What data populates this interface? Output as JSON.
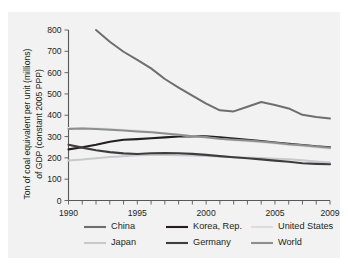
{
  "figure": {
    "background": "#f2f2f2",
    "page_background": "#ffffff"
  },
  "chart_data": {
    "type": "line",
    "title": "",
    "subtitle": "",
    "xlabel": "",
    "ylabel": "Ton of coal equivalent per unit (millions) of GDP (constant 2005 PPP)",
    "ylabel_line1": "Ton of coal equivalent per unit (millions)",
    "ylabel_line2": "of GDP (constant 2005 PPP)",
    "xlim": [
      1990,
      2009
    ],
    "ylim": [
      0,
      800
    ],
    "yticks": [
      0,
      100,
      200,
      300,
      400,
      500,
      600,
      700,
      800
    ],
    "ytick_labels": [
      "0",
      "100",
      "200",
      "300",
      "400",
      "500",
      "600",
      "700",
      "800"
    ],
    "xticks": [
      1990,
      1991,
      1992,
      1993,
      1994,
      1995,
      1996,
      1997,
      1998,
      1999,
      2000,
      2001,
      2002,
      2003,
      2004,
      2005,
      2006,
      2007,
      2008,
      2009
    ],
    "xtick_labels_shown": [
      "1990",
      "1995",
      "2000",
      "2005",
      "2009"
    ],
    "xtick_labels_shown_at": [
      1990,
      1995,
      2000,
      2005,
      2009
    ],
    "grid": false,
    "legend_position": "bottom",
    "x": [
      1990,
      1991,
      1992,
      1993,
      1994,
      1995,
      1996,
      1997,
      1998,
      1999,
      2000,
      2001,
      2002,
      2003,
      2004,
      2005,
      2006,
      2007,
      2008,
      2009
    ],
    "series": [
      {
        "name": "China",
        "color": "#6e6e70",
        "width": 2.0,
        "x": [
          1992,
          1993,
          1994,
          1995,
          1996,
          1997,
          1998,
          1999,
          2000,
          2001,
          2002,
          2003,
          2004,
          2005,
          2006,
          2007,
          2008,
          2009
        ],
        "values": [
          800,
          745,
          698,
          660,
          620,
          570,
          530,
          492,
          455,
          423,
          418,
          440,
          462,
          448,
          432,
          402,
          392,
          385
        ]
      },
      {
        "name": "Japan",
        "color": "#c9c9cb",
        "width": 2.0,
        "x": [
          1990,
          1991,
          1992,
          1993,
          1994,
          1995,
          1996,
          1997,
          1998,
          1999,
          2000,
          2001,
          2002,
          2003,
          2004,
          2005,
          2006,
          2007,
          2008,
          2009
        ],
        "values": [
          188,
          192,
          198,
          204,
          208,
          212,
          213,
          213,
          212,
          211,
          209,
          206,
          203,
          201,
          199,
          196,
          193,
          189,
          183,
          178
        ]
      },
      {
        "name": "Korea, Rep.",
        "color": "#231f20",
        "width": 2.1,
        "x": [
          1990,
          1991,
          1992,
          1993,
          1994,
          1995,
          1996,
          1997,
          1998,
          1999,
          2000,
          2001,
          2002,
          2003,
          2004,
          2005,
          2006,
          2007,
          2008,
          2009
        ],
        "values": [
          240,
          250,
          262,
          276,
          285,
          288,
          292,
          296,
          300,
          301,
          301,
          297,
          291,
          285,
          279,
          272,
          266,
          260,
          254,
          250
        ]
      },
      {
        "name": "Germany",
        "color": "#3d3d3f",
        "width": 2.1,
        "x": [
          1990,
          1991,
          1992,
          1993,
          1994,
          1995,
          1996,
          1997,
          1998,
          1999,
          2000,
          2001,
          2002,
          2003,
          2004,
          2005,
          2006,
          2007,
          2008,
          2009
        ],
        "values": [
          262,
          248,
          236,
          227,
          221,
          218,
          222,
          223,
          222,
          219,
          214,
          208,
          203,
          198,
          193,
          187,
          182,
          175,
          172,
          170
        ]
      },
      {
        "name": "United States",
        "color": "#dcdcdd",
        "width": 2.0,
        "x": [
          1990,
          1991,
          1992,
          1993,
          1994,
          1995,
          1996,
          1997,
          1998,
          1999,
          2000,
          2001,
          2002,
          2003,
          2004,
          2005,
          2006,
          2007,
          2008,
          2009
        ],
        "values": [
          340,
          340,
          338,
          335,
          331,
          327,
          323,
          316,
          309,
          302,
          296,
          288,
          283,
          278,
          273,
          267,
          260,
          256,
          250,
          243
        ]
      },
      {
        "name": "World",
        "color": "#8e8e90",
        "width": 2.0,
        "x": [
          1990,
          1991,
          1992,
          1993,
          1994,
          1995,
          1996,
          1997,
          1998,
          1999,
          2000,
          2001,
          2002,
          2003,
          2004,
          2005,
          2006,
          2007,
          2008,
          2009
        ],
        "values": [
          336,
          338,
          336,
          332,
          328,
          324,
          320,
          314,
          308,
          302,
          297,
          290,
          285,
          281,
          277,
          271,
          264,
          259,
          253,
          248
        ]
      }
    ],
    "legend": [
      {
        "label": "China",
        "color": "#6e6e70"
      },
      {
        "label": "Korea, Rep.",
        "color": "#231f20"
      },
      {
        "label": "United States",
        "color": "#dcdcdd"
      },
      {
        "label": "Japan",
        "color": "#c9c9cb"
      },
      {
        "label": "Germany",
        "color": "#3d3d3f"
      },
      {
        "label": "World",
        "color": "#8e8e90"
      }
    ]
  }
}
